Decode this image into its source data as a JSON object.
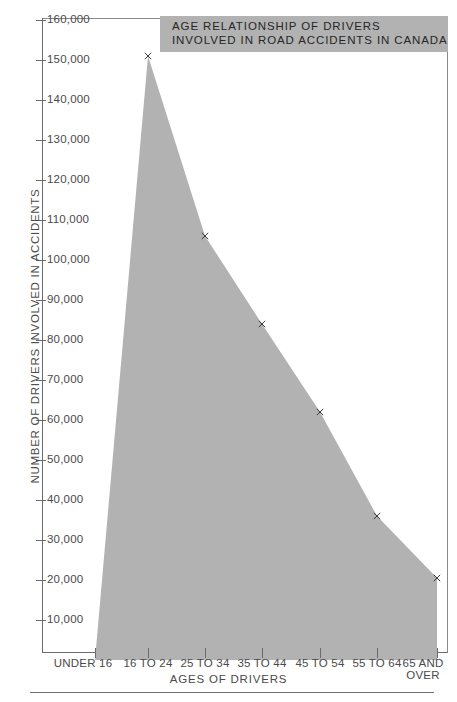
{
  "chart_data": {
    "type": "area",
    "title": "AGE RELATIONSHIP OF DRIVERS INVOLVED IN ROAD ACCIDENTS IN CANADA",
    "title_lines": [
      "AGE RELATIONSHIP OF DRIVERS",
      "INVOLVED IN ROAD ACCIDENTS IN CANADA"
    ],
    "xlabel": "AGES OF DRIVERS",
    "ylabel": "NUMBER OF DRIVERS INVOLVED IN ACCIDENTS",
    "categories": [
      "UNDER 16",
      "16 TO 24",
      "25 TO 34",
      "35 TO 44",
      "45 TO 54",
      "55 TO 64",
      "65 AND\nOVER"
    ],
    "values": [
      0,
      151000,
      106000,
      84000,
      62000,
      36000,
      20500
    ],
    "ylim": [
      0,
      160000
    ],
    "xlim_categories": 7,
    "ytick_values": [
      160000,
      150000,
      140000,
      130000,
      120000,
      110000,
      100000,
      90000,
      80000,
      70000,
      60000,
      50000,
      40000,
      30000,
      20000,
      10000
    ],
    "ytick_labels": [
      "160,000",
      "150,000",
      "140,000",
      "130,000",
      "120,000",
      "110,000",
      "100,000",
      "90,000",
      "80,000",
      "70,000",
      "60,000",
      "50,000",
      "40,000",
      "30,000",
      "20,000",
      "10,000"
    ],
    "marker": "x",
    "grid": false,
    "legend": "none",
    "colors": {
      "area_fill": "#b2b2b2",
      "axis": "#6b6b6b",
      "text": "#4a4a4a",
      "title_background": "#b2b2b2",
      "title_text": "#262626",
      "marker": "#3a3a3a"
    }
  }
}
